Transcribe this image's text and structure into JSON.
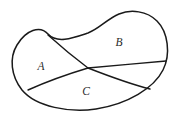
{
  "figure": {
    "type": "diagram",
    "width": 175,
    "height": 121,
    "background_color": "#ffffff",
    "stroke_color": "#1a1a1a"
  },
  "labels": {
    "region_a": "A",
    "region_b": "B",
    "region_c": "C"
  },
  "label_positions": {
    "region_a": {
      "x": 41,
      "y": 67
    },
    "region_b": {
      "x": 119,
      "y": 43
    },
    "region_c": {
      "x": 86,
      "y": 92
    }
  },
  "geometry": {
    "outline_path": "M 48 34 C 40 25 26 30 17 45 C 9 58 11 76 22 90 C 36 107 70 113 96 109 C 128 104 154 88 163 70 C 171 54 168 32 157 21 C 147 11 131 9 119 14 C 107 19 99 29 88 33 C 73 38 57 44 48 34 Z",
    "divider_upper_path": "M 48 35 C 58 44 72 56 88 68 C 110 66 142 63 166 61",
    "divider_lower_path": "M 28 90 C 48 81 68 74 88 68 C 106 75 130 84 150 89",
    "crossing_point": {
      "x": 88,
      "y": 68
    },
    "divider_upper_start": {
      "x": 48,
      "y": 35
    },
    "divider_upper_end": {
      "x": 166,
      "y": 61
    },
    "divider_lower_start": {
      "x": 28,
      "y": 90
    },
    "divider_lower_end": {
      "x": 150,
      "y": 89
    }
  }
}
